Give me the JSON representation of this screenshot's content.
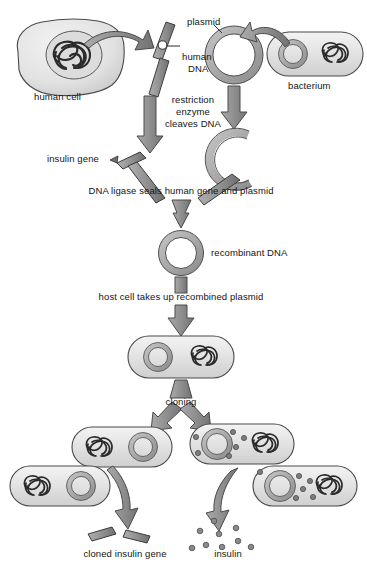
{
  "diagram": {
    "colors": {
      "fill_light": "#e6e6e6",
      "fill_mid": "#b9b9b9",
      "fill_dark": "#8f8f8f",
      "stroke": "#3b3b3b",
      "text": "#141414",
      "arrow": "#8c8c8c",
      "arrow_stroke": "#4a4a4a",
      "background": "#ffffff"
    },
    "labels": {
      "human_cell": "human cell",
      "human_dna": "human\nDNA",
      "human_dna_line1": "human",
      "human_dna_line2": "DNA",
      "plasmid": "plasmid",
      "bacterium": "bacterium",
      "restriction_line1": "restriction",
      "restriction_line2": "enzyme",
      "restriction_line3": "cleaves DNA",
      "insulin_gene": "insulin gene",
      "dna_ligase": "DNA ligase seals human gene and plasmid",
      "recombinant_dna": "recombinant DNA",
      "host_cell": "host cell takes up recombined plasmid",
      "cloning": "cloning",
      "cloned_insulin_gene": "cloned insulin gene",
      "insulin": "insulin"
    },
    "steps": [
      {
        "id": "human-cell",
        "label": "human cell",
        "description": "Human cell with nucleus containing tangled chromosomal DNA"
      },
      {
        "id": "human-chromosome",
        "label": "human DNA",
        "description": "Human chromosome rod with centromere"
      },
      {
        "id": "plasmid",
        "label": "plasmid",
        "description": "Circular bacterial plasmid ring"
      },
      {
        "id": "bacterium",
        "label": "bacterium",
        "description": "Bacterium capsule containing plasmid ring and tangled DNA"
      },
      {
        "id": "restriction-enzyme",
        "label": "restriction enzyme cleaves DNA",
        "description": "Restriction enzyme cuts human DNA and plasmid"
      },
      {
        "id": "insulin-gene",
        "label": "insulin gene",
        "description": "Excised insulin gene fragment"
      },
      {
        "id": "opened-plasmid",
        "label": "",
        "description": "Plasmid cut open into a C shape"
      },
      {
        "id": "dna-ligase",
        "label": "DNA ligase seals human gene and plasmid",
        "description": "Ligation step joining gene and plasmid"
      },
      {
        "id": "recombinant-dna",
        "label": "recombinant DNA",
        "description": "Closed recombinant plasmid ring"
      },
      {
        "id": "host-uptake",
        "label": "host cell takes up recombined plasmid",
        "description": "Transformation of host bacterium"
      },
      {
        "id": "host-cell",
        "label": "",
        "description": "Host bacterium with recombinant plasmid and chromosomal DNA"
      },
      {
        "id": "cloning",
        "label": "cloning",
        "description": "Cloning splits into two outcomes"
      },
      {
        "id": "clone-gene-branch",
        "label": "cloned insulin gene",
        "description": "Bacteria multiplied carrying the cloned gene"
      },
      {
        "id": "clone-insulin-branch",
        "label": "insulin",
        "description": "Bacteria producing insulin protein"
      }
    ]
  }
}
